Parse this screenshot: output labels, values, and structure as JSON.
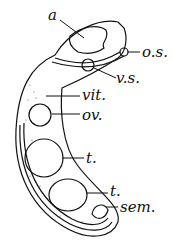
{
  "diagram": {
    "type": "anatomical-illustration",
    "labels": {
      "a": "a",
      "os": "o.s.",
      "vs": "v.s.",
      "vit": "vit.",
      "ov": "ov.",
      "t1": "t.",
      "t2": "t.",
      "sem": "sem."
    }
  }
}
